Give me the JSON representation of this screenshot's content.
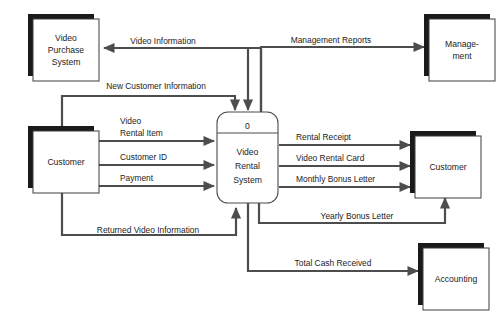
{
  "diagram": {
    "type": "data-flow-diagram",
    "colors": {
      "background": "#ffffff",
      "line": "#4d4d4d",
      "box_stroke": "#3c3c3c",
      "shadow": "#1a1a1a",
      "text": "#1c1c1c"
    }
  },
  "entities": {
    "video_purchase_system": {
      "line1": "Video",
      "line2": "Purchase",
      "line3": "System"
    },
    "customer_left": {
      "label": "Customer"
    },
    "management": {
      "line1": "Manage-",
      "line2": "ment"
    },
    "customer_right": {
      "label": "Customer"
    },
    "accounting": {
      "label": "Accounting"
    }
  },
  "process": {
    "number": "0",
    "line1": "Video",
    "line2": "Rental",
    "line3": "System"
  },
  "flows": {
    "video_information": "Video Information",
    "management_reports": "Management Reports",
    "new_customer_information": "New Customer Information",
    "video_rental_item_l1": "Video",
    "video_rental_item_l2": "Rental Item",
    "customer_id": "Customer ID",
    "payment": "Payment",
    "rental_receipt": "Rental Receipt",
    "video_rental_card": "Video Rental Card",
    "monthly_bonus_letter": "Monthly Bonus Letter",
    "yearly_bonus_letter": "Yearly Bonus Letter",
    "returned_video_information": "Returned Video Information",
    "total_cash_received": "Total Cash Received"
  }
}
